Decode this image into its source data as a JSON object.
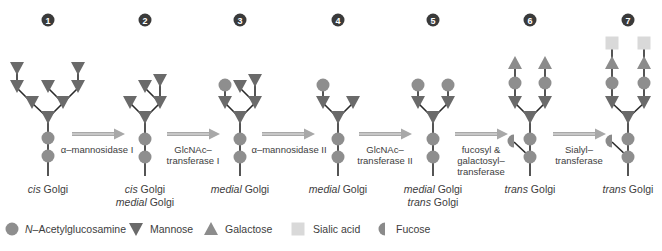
{
  "colors": {
    "glcnac": "#8e8e8e",
    "mannose": "#6a6a6a",
    "galactose": "#8c8c8c",
    "sialic": "#d9d9d9",
    "fucose": "#8a8a8a",
    "bond": "#2a2a2a",
    "arrow": "#a8a8a8",
    "badge": "#3a3a3a"
  },
  "stages": [
    {
      "number": "1",
      "location": [
        "cis Golgi"
      ],
      "location_italic": [
        "cis"
      ]
    },
    {
      "number": "2",
      "location": [
        "cis Golgi",
        "medial Golgi"
      ]
    },
    {
      "number": "3",
      "location": [
        "medial Golgi"
      ]
    },
    {
      "number": "4",
      "location": [
        "medial Golgi"
      ]
    },
    {
      "number": "5",
      "location": [
        "medial Golgi",
        "trans Golgi"
      ]
    },
    {
      "number": "6",
      "location": [
        "trans Golgi"
      ]
    },
    {
      "number": "7",
      "location": [
        "trans Golgi"
      ]
    }
  ],
  "location_labels": {
    "s1": {
      "it": "cis",
      "rest": " Golgi"
    },
    "s2a": {
      "it": "cis",
      "rest": " Golgi"
    },
    "s2b": {
      "it": "medial",
      "rest": " Golgi"
    },
    "s3": {
      "it": "medial",
      "rest": " Golgi"
    },
    "s4": {
      "it": "medial",
      "rest": " Golgi"
    },
    "s5a": {
      "it": "medial",
      "rest": " Golgi"
    },
    "s5b": {
      "it": "trans",
      "rest": " Golgi"
    },
    "s6": {
      "it": "trans",
      "rest": " Golgi"
    },
    "s7": {
      "it": "trans",
      "rest": " Golgi"
    }
  },
  "enzymes": [
    {
      "lines": [
        "α–mannosidase I"
      ]
    },
    {
      "lines": [
        "GlcNAc–",
        "transferase I"
      ]
    },
    {
      "lines": [
        "α–mannosidase II"
      ]
    },
    {
      "lines": [
        "GlcNAc–",
        "transferase II"
      ]
    },
    {
      "lines": [
        "fucosyl &",
        "galactosyl–",
        "transferase"
      ]
    },
    {
      "lines": [
        "Sialyl–",
        "transferase"
      ]
    }
  ],
  "legend": {
    "glcnac": {
      "it": "N",
      "rest": "–Acetylglucosamine"
    },
    "mannose": "Mannose",
    "galactose": "Galactose",
    "sialic": "Sialic acid",
    "fucose": "Fucose"
  }
}
